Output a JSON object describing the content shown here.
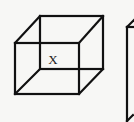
{
  "diagram": {
    "type": "wireframe-cube",
    "figures": [
      {
        "id": "cube-main",
        "label": "X",
        "vertices": {
          "front_top_left": [
            15,
            43
          ],
          "front_top_right": [
            79,
            43
          ],
          "front_bottom_left": [
            15,
            94
          ],
          "front_bottom_right": [
            79,
            94
          ],
          "back_top_left": [
            40,
            16
          ],
          "back_top_right": [
            103,
            16
          ],
          "back_bottom_left": [
            40,
            69
          ],
          "back_bottom_right": [
            103,
            69
          ]
        },
        "label_position": [
          53,
          64
        ]
      },
      {
        "id": "cube-partial-right",
        "label": "",
        "note": "partially visible, cropped at right edge"
      }
    ],
    "colors": {
      "background": "#f7f7f5",
      "stroke": "#111111",
      "label": "#222222"
    }
  }
}
